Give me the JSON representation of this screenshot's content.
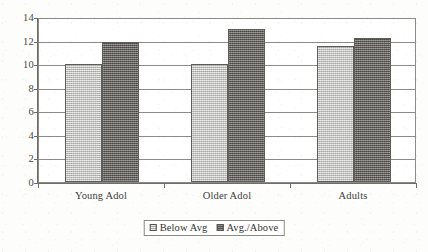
{
  "chart_data": {
    "type": "bar",
    "title": "",
    "subtitle": "",
    "xlabel": "",
    "ylabel": "",
    "categories": [
      "Young Adol",
      "Older Adol",
      "Adults"
    ],
    "series": [
      {
        "name": "Below Avg",
        "values": [
          10.0,
          10.0,
          11.5
        ],
        "color": "#c2c2c0"
      },
      {
        "name": "Avg./Above",
        "values": [
          11.9,
          13.0,
          12.2
        ],
        "color": "#6e6c69"
      }
    ],
    "ylim": [
      0,
      14
    ],
    "ytick_labels": [
      "14",
      "12",
      "10",
      "8",
      "6",
      "4",
      "2",
      "0"
    ],
    "ytick_values": [
      14,
      12,
      10,
      8,
      6,
      4,
      2,
      0
    ],
    "grid": true,
    "grid_axis": "y",
    "legend_position": "bottom-center",
    "bar_mode": "grouped",
    "annotations": []
  },
  "legend": {
    "items": [
      {
        "label": "Below Avg"
      },
      {
        "label": "Avg./Above"
      }
    ]
  }
}
